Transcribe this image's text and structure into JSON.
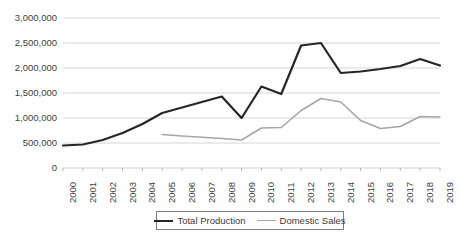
{
  "chart_data": {
    "type": "line",
    "title": "",
    "xlabel": "",
    "ylabel": "",
    "ylim": [
      0,
      3000000
    ],
    "ytick_step": 500000,
    "ytick_labels": [
      "3,000,000",
      "2,500,000",
      "2,000,000",
      "1,500,000",
      "1,000,000",
      "500,000",
      "0"
    ],
    "ytick_values": [
      3000000,
      2500000,
      2000000,
      1500000,
      1000000,
      500000,
      0
    ],
    "grid": true,
    "legend_position": "bottom",
    "categories": [
      "2000",
      "2001",
      "2002",
      "2003",
      "2004",
      "2005",
      "2006",
      "2007",
      "2008",
      "2009",
      "2010",
      "2011",
      "2012",
      "2013",
      "2014",
      "2015",
      "2016",
      "2017",
      "2018",
      "2019"
    ],
    "series": [
      {
        "name": "Total Production",
        "color": "#262626",
        "line_width": 2.2,
        "values": [
          450000,
          470000,
          560000,
          700000,
          880000,
          1100000,
          1210000,
          1320000,
          1430000,
          1000000,
          1630000,
          1480000,
          2450000,
          2500000,
          1900000,
          1930000,
          1980000,
          2040000,
          2180000,
          2050000
        ]
      },
      {
        "name": "Domestic Sales",
        "color": "#a6a6a6",
        "line_width": 1.6,
        "values": [
          null,
          null,
          null,
          null,
          null,
          670000,
          640000,
          615000,
          590000,
          560000,
          800000,
          810000,
          1150000,
          1390000,
          1320000,
          950000,
          790000,
          830000,
          1030000,
          1020000
        ]
      }
    ]
  },
  "legend": {
    "entries": [
      {
        "label": "Total Production"
      },
      {
        "label": "Domestic Sales"
      }
    ]
  },
  "axis_colors": {
    "grid": "#d0d0d0",
    "axis": "#a6a6a6",
    "tick_text": "#404040"
  }
}
